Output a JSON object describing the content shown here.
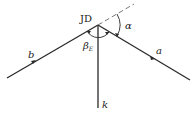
{
  "diagram": {
    "vertex_label": "JD",
    "alpha_label": "α",
    "beta_label": "β",
    "beta_subscript": "E",
    "line_a_label": "a",
    "line_b_label": "b",
    "line_k_label": "k",
    "stroke_color": "#2a2a2a",
    "dash_color": "#6a6a6a"
  }
}
